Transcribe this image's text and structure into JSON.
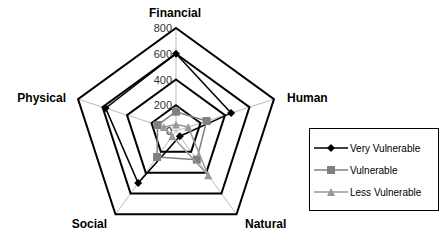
{
  "chart_data": {
    "type": "radar",
    "categories": [
      "Financial",
      "Human",
      "Natural",
      "Social",
      "Physical"
    ],
    "radial_ticks": [
      "0",
      "200",
      "400",
      "600",
      "800"
    ],
    "rmax": 800,
    "series": [
      {
        "name": "Very Vulnerable",
        "marker": "diamond",
        "color": "#000000",
        "values": [
          600,
          450,
          50,
          500,
          575
        ]
      },
      {
        "name": "Vulnerable",
        "marker": "square",
        "color": "#808080",
        "values": [
          150,
          250,
          275,
          250,
          150
        ]
      },
      {
        "name": "Less Vulnerable",
        "marker": "triangle",
        "color": "#999999",
        "values": [
          50,
          100,
          425,
          50,
          100
        ]
      }
    ],
    "legend_position": "right",
    "grid": true
  }
}
